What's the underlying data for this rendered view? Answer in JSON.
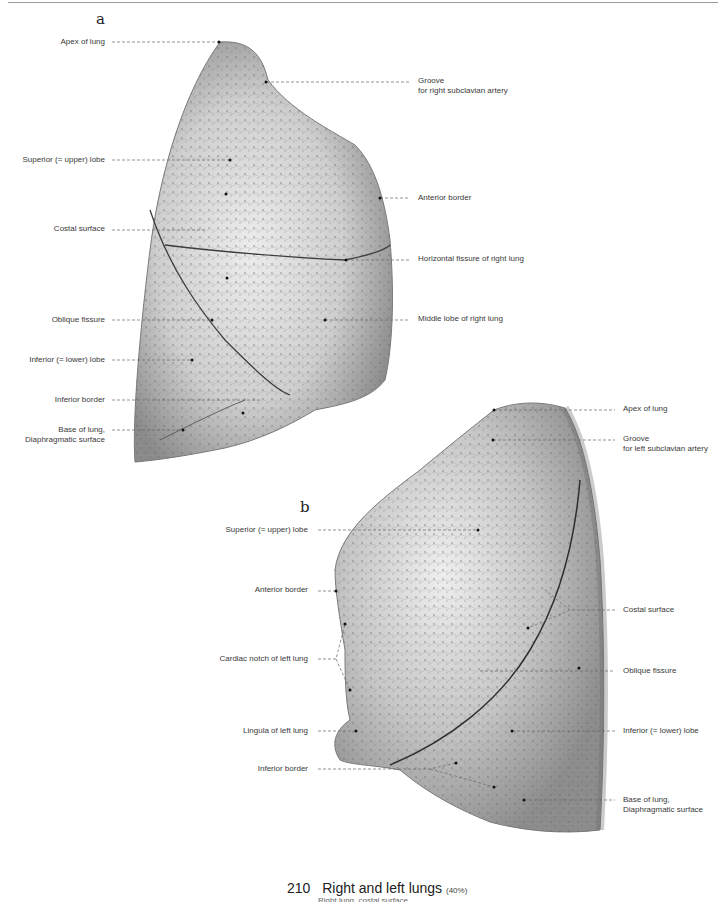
{
  "figure": {
    "caption_number": "210",
    "caption_title": "Right and left lungs",
    "caption_scale": "(40%)",
    "caption_subline": "Right lung, costal surface"
  },
  "panel_a": {
    "letter": "a",
    "subject": "Right lung, lateral (costal) view",
    "labels_left": [
      "Apex of lung",
      "Superior (= upper) lobe",
      "Costal surface",
      "Oblique fissure",
      "Inferior (= lower) lobe",
      "Inferior border",
      "Base of lung,",
      "Diaphragmatic surface"
    ],
    "labels_right": [
      "Groove",
      "for right subclavian artery",
      "Anterior border",
      "Horizontal fissure of right lung",
      "Middle lobe of right lung"
    ]
  },
  "panel_b": {
    "letter": "b",
    "subject": "Left lung, lateral (costal) view",
    "labels_left": [
      "Superior (= upper) lobe",
      "Anterior border",
      "Cardiac notch of left lung",
      "Lingula of left lung",
      "Inferior border"
    ],
    "labels_right": [
      "Apex of lung",
      "Groove",
      "for left subclavian artery",
      "Costal surface",
      "Oblique fissure",
      "Inferior (= lower) lobe",
      "Base of lung,",
      "Diaphragmatic surface"
    ]
  },
  "colors": {
    "tissue_light": "#d9d9d9",
    "tissue_mid": "#a8a8a8",
    "tissue_dark": "#6e6e6e",
    "leader_line": "#555555",
    "text": "#3a3a3a"
  }
}
